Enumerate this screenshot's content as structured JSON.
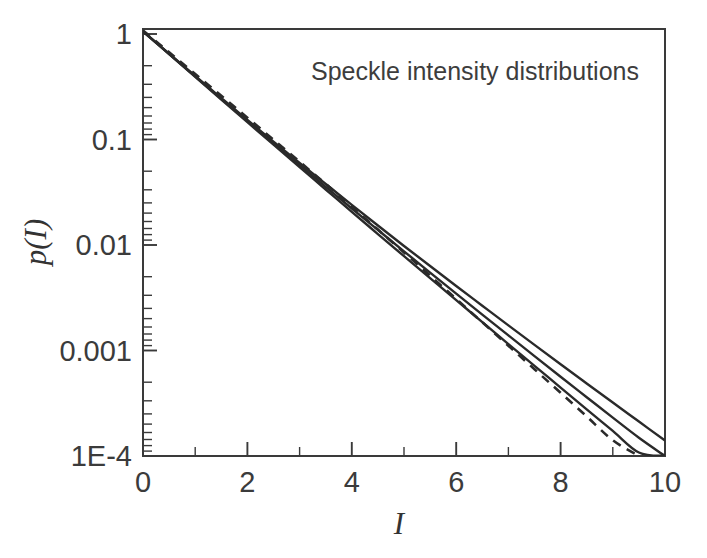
{
  "figure": {
    "title": "Speckle intensity distributions",
    "background_color": "#ffffff",
    "axis_color": "#3a3a3a",
    "curve_color": "#2a2a2a"
  },
  "axes": {
    "x": {
      "label": "I",
      "label_style": "italic",
      "scale": "linear",
      "min": 0,
      "max": 10,
      "major_ticks": [
        0,
        2,
        4,
        6,
        8,
        10
      ],
      "major_tick_labels": [
        "0",
        "2",
        "4",
        "6",
        "8",
        "10"
      ],
      "minor_ticks": [
        1,
        3,
        5,
        7,
        9
      ]
    },
    "y": {
      "label": "p(I)",
      "label_style": "italic",
      "scale": "log",
      "min": 0.0001,
      "max": 1.3,
      "major_ticks": [
        1,
        0.1,
        0.01,
        0.001,
        0.0001
      ],
      "major_tick_labels": [
        "1",
        "0.1",
        "0.01",
        "0.001",
        "1E-4"
      ]
    }
  },
  "chart_data": {
    "type": "line",
    "title": "Speckle intensity distributions",
    "xlabel": "I",
    "ylabel": "p(I)",
    "xlim": [
      0,
      10
    ],
    "ylim": [
      0.0001,
      1.3
    ],
    "yscale": "log",
    "grid": false,
    "legend": "none",
    "x": [
      0,
      0.5,
      1,
      1.5,
      2,
      2.5,
      3,
      3.5,
      4,
      4.5,
      5,
      5.5,
      6,
      6.5,
      7,
      7.5,
      8,
      8.5,
      9,
      9.5,
      10
    ],
    "series": [
      {
        "name": "curve-1-widest-tail",
        "style": "solid",
        "color": "#2a2a2a",
        "values": [
          1.06,
          0.65,
          0.4,
          0.247,
          0.153,
          0.0955,
          0.06,
          0.0379,
          0.024,
          0.0153,
          0.0098,
          0.00632,
          0.00409,
          0.00266,
          0.00173,
          0.00113,
          0.00074,
          0.000487,
          0.000321,
          0.000212,
          0.00014
        ]
      },
      {
        "name": "curve-2-mid-tail",
        "style": "solid",
        "color": "#2a2a2a",
        "values": [
          1.06,
          0.647,
          0.396,
          0.243,
          0.15,
          0.0925,
          0.0573,
          0.0356,
          0.0222,
          0.0139,
          0.00871,
          0.00548,
          0.00346,
          0.00219,
          0.00139,
          0.000884,
          0.000564,
          0.000361,
          0.000231,
          0.000149,
          9.57e-05
        ]
      },
      {
        "name": "curve-3-narrow-tail",
        "style": "solid",
        "color": "#2a2a2a",
        "values": [
          1.06,
          0.644,
          0.392,
          0.239,
          0.146,
          0.0893,
          0.0547,
          0.0336,
          0.0206,
          0.0127,
          0.00784,
          0.00485,
          0.003,
          0.00186,
          0.00115,
          0.000716,
          0.000445,
          0.000277,
          0.000173,
          0.000108,
          6.76e-05
        ]
      },
      {
        "name": "curve-4-negative-exponential",
        "style": "dashed",
        "color": "#2a2a2a",
        "values": [
          1.08,
          0.672,
          0.418,
          0.26,
          0.161,
          0.0996,
          0.0616,
          0.0379,
          0.0231,
          0.014,
          0.0085,
          0.00512,
          0.00308,
          0.00185,
          0.00111,
          0.000664,
          0.000397,
          0.000237,
          0.000141,
          8.42e-05,
          5e-05
        ]
      }
    ]
  }
}
